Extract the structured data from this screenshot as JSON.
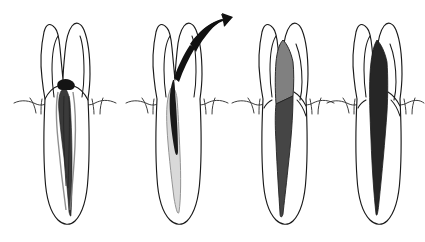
{
  "figure": {
    "title": "Endodontic post removal and canal obturation sequence",
    "background_color": "#ffffff",
    "width": 425,
    "height": 242,
    "panel_count": 4,
    "style": "black ink line drawing, hand-drawn"
  },
  "colors": {
    "outline": "#1a1a1a",
    "gum_line": "#333333",
    "background": "#ffffff",
    "post_gray": "#808080",
    "filling_dark_gray": "#454545",
    "filling_black": "#262626",
    "canal_empty_light": "#d9d9d9",
    "arrow_black": "#111111"
  },
  "panels": [
    {
      "index": 1,
      "name": "panel-existing-post",
      "caption": "Tooth with existing metal post and root canal filling in place",
      "center_x": 65,
      "crown_present": true,
      "canal_state": "filled-with-post",
      "post_color": "#555555",
      "filling_color": "#3a3a3a",
      "arrow_present": false
    },
    {
      "index": 2,
      "name": "panel-post-removal",
      "caption": "Post being withdrawn from the canal, leaving an emptied light canal space",
      "center_x": 177,
      "crown_present": true,
      "canal_state": "being-emptied",
      "post_color": "#d9d9d9",
      "filling_color": "#1a1a1a",
      "arrow_present": true,
      "arrow_direction": "up-right",
      "arrow_color": "#111111"
    },
    {
      "index": 3,
      "name": "panel-new-post-seated",
      "caption": "New gray post seated in the coronal canal with dark obturation below",
      "center_x": 283,
      "crown_present": true,
      "canal_state": "post-and-fill",
      "post_color": "#808080",
      "filling_color": "#454545",
      "arrow_present": false
    },
    {
      "index": 4,
      "name": "panel-final-obturation",
      "caption": "Completed canal fully obturated with dense filling material",
      "center_x": 377,
      "crown_present": true,
      "canal_state": "fully-filled",
      "post_color": "#262626",
      "filling_color": "#262626",
      "arrow_present": false
    }
  ],
  "annotations": {
    "arrow_label": "removal-direction-arrow",
    "gum_label": "gingival-line"
  }
}
